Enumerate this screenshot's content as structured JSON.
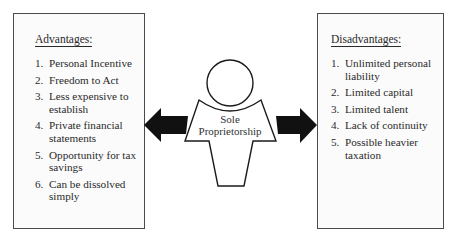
{
  "advantages": {
    "heading": "Advantages:",
    "items": [
      {
        "num": "1.",
        "text": "Personal Incentive"
      },
      {
        "num": "2.",
        "text": "Freedom to Act"
      },
      {
        "num": "3.",
        "text": "Less expensive to establish"
      },
      {
        "num": "4.",
        "text": "Private financial statements"
      },
      {
        "num": "5.",
        "text": "Opportunity for tax savings"
      },
      {
        "num": "6.",
        "text": "Can be dissolved simply"
      }
    ]
  },
  "center": {
    "label_line1": "Sole",
    "label_line2": "Proprietorship"
  },
  "disadvantages": {
    "heading": "Disadvantages:",
    "items": [
      {
        "num": "1.",
        "text": "Unlimited personal liability"
      },
      {
        "num": "2.",
        "text": "Limited capital"
      },
      {
        "num": "3.",
        "text": "Limited talent"
      },
      {
        "num": "4.",
        "text": "Lack of continuity"
      },
      {
        "num": "5.",
        "text": "Possible heavier taxation"
      }
    ]
  }
}
